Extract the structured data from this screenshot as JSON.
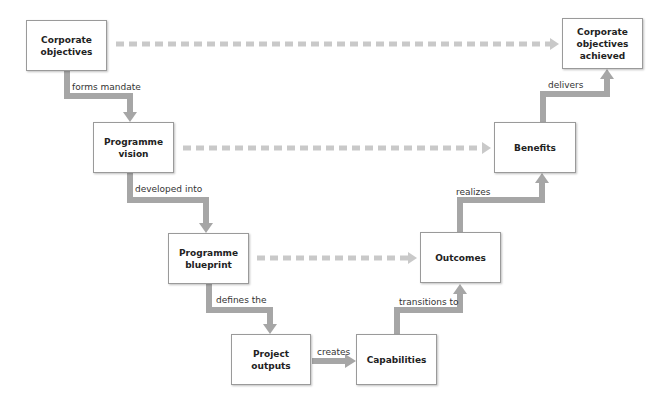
{
  "colors": {
    "solid_connector": "#a6a6a6",
    "dashed_connector": "#c9c9c9",
    "box_border": "#9a9a9a",
    "text": "#222222"
  },
  "nodes": [
    {
      "id": "corporate-objectives",
      "label": "Corporate objectives",
      "x": 26,
      "y": 20,
      "w": 81,
      "h": 51
    },
    {
      "id": "programme-vision",
      "label": "Programme vision",
      "x": 93,
      "y": 122,
      "w": 81,
      "h": 51
    },
    {
      "id": "programme-blueprint",
      "label": "Programme blueprint",
      "x": 168,
      "y": 233,
      "w": 81,
      "h": 51
    },
    {
      "id": "project-outputs",
      "label": "Project outputs",
      "x": 231,
      "y": 334,
      "w": 80,
      "h": 51
    },
    {
      "id": "capabilities",
      "label": "Capabilities",
      "x": 356,
      "y": 334,
      "w": 81,
      "h": 51
    },
    {
      "id": "outcomes",
      "label": "Outcomes",
      "x": 420,
      "y": 232,
      "w": 81,
      "h": 51
    },
    {
      "id": "benefits",
      "label": "Benefits",
      "x": 494,
      "y": 122,
      "w": 82,
      "h": 51
    },
    {
      "id": "corporate-objectives-achieved",
      "label": "Corporate objectives achieved",
      "x": 562,
      "y": 18,
      "w": 81,
      "h": 51
    }
  ],
  "edges": [
    {
      "from": "corporate-objectives",
      "to": "programme-vision",
      "label": "forms mandate",
      "label_x": 72,
      "label_y": 82
    },
    {
      "from": "programme-vision",
      "to": "programme-blueprint",
      "label": "developed into",
      "label_x": 135,
      "label_y": 184
    },
    {
      "from": "programme-blueprint",
      "to": "project-outputs",
      "label": "defines the",
      "label_x": 216,
      "label_y": 295
    },
    {
      "from": "project-outputs",
      "to": "capabilities",
      "label": "creates",
      "label_x": 317,
      "label_y": 347
    },
    {
      "from": "capabilities",
      "to": "outcomes",
      "label": "transitions to",
      "label_x": 399,
      "label_y": 297
    },
    {
      "from": "outcomes",
      "to": "benefits",
      "label": "realizes",
      "label_x": 456,
      "label_y": 187
    },
    {
      "from": "benefits",
      "to": "corporate-objectives-achieved",
      "label": "delivers",
      "label_x": 548,
      "label_y": 80
    }
  ],
  "dashed_edges": [
    {
      "from": "corporate-objectives",
      "to": "corporate-objectives-achieved"
    },
    {
      "from": "programme-vision",
      "to": "benefits"
    },
    {
      "from": "programme-blueprint",
      "to": "outcomes"
    }
  ]
}
